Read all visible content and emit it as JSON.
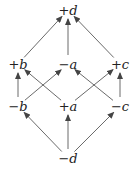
{
  "diagram": {
    "nodes": [
      {
        "id": "pd",
        "sign": "+",
        "var": "d",
        "x": 68,
        "y": 10
      },
      {
        "id": "pb",
        "sign": "+",
        "var": "b",
        "x": 18,
        "y": 64
      },
      {
        "id": "ma",
        "sign": "−",
        "var": "a",
        "x": 68,
        "y": 64
      },
      {
        "id": "pc",
        "sign": "+",
        "var": "c",
        "x": 120,
        "y": 64
      },
      {
        "id": "mb",
        "sign": "−",
        "var": "b",
        "x": 18,
        "y": 106
      },
      {
        "id": "pa",
        "sign": "+",
        "var": "a",
        "x": 68,
        "y": 106
      },
      {
        "id": "mc",
        "sign": "−",
        "var": "c",
        "x": 120,
        "y": 106
      },
      {
        "id": "md",
        "sign": "−",
        "var": "d",
        "x": 68,
        "y": 158
      }
    ],
    "edges": [
      {
        "from": "pb",
        "to": "pd"
      },
      {
        "from": "ma",
        "to": "pd"
      },
      {
        "from": "pc",
        "to": "pd"
      },
      {
        "from": "mb",
        "to": "pb"
      },
      {
        "from": "pa",
        "to": "pb"
      },
      {
        "from": "mb",
        "to": "ma"
      },
      {
        "from": "mc",
        "to": "ma"
      },
      {
        "from": "pa",
        "to": "pc"
      },
      {
        "from": "mc",
        "to": "pc"
      },
      {
        "from": "md",
        "to": "mb"
      },
      {
        "from": "md",
        "to": "pa"
      },
      {
        "from": "md",
        "to": "mc"
      }
    ]
  },
  "colors": {
    "line": "#444444",
    "text": "#222222"
  }
}
